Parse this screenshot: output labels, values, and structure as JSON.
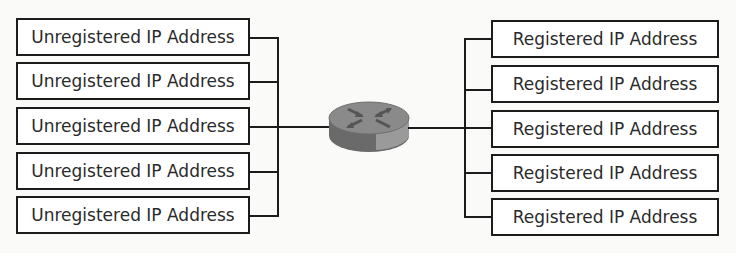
{
  "diagram": {
    "title": "",
    "left_group": {
      "label": "Private network",
      "nodes": [
        {
          "label": "Unregistered IP Address",
          "top": 18
        },
        {
          "label": "Unregistered IP Address",
          "top": 62
        },
        {
          "label": "Unregistered IP Address",
          "top": 107
        },
        {
          "label": "Unregistered IP Address",
          "top": 152
        },
        {
          "label": "Unregistered IP Address",
          "top": 196
        }
      ]
    },
    "router": {
      "icon": "router-icon"
    },
    "right_group": {
      "label": "Public network",
      "nodes": [
        {
          "label": "Registered IP Address",
          "top": 20
        },
        {
          "label": "Registered IP Address",
          "top": 65
        },
        {
          "label": "Registered IP Address",
          "top": 110
        },
        {
          "label": "Registered IP Address",
          "top": 154
        },
        {
          "label": "Registered IP Address",
          "top": 198
        }
      ]
    },
    "colors": {
      "line": "#1c1c1c",
      "router_top": "#8a8a8a",
      "router_side": "#6a6a6a"
    }
  }
}
